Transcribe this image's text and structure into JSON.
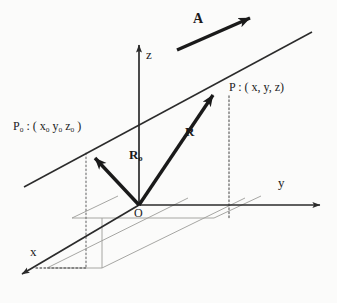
{
  "figure": {
    "background_color": "#fbfbfa",
    "ink_color": "#1a1a1a",
    "plane_line_color": "#9a9a96",
    "axes": [
      {
        "name": "z",
        "label": "z",
        "direction": "up"
      },
      {
        "name": "y",
        "label": "y",
        "direction": "right"
      },
      {
        "name": "x",
        "label": "x",
        "direction": "down-left"
      }
    ],
    "origin": {
      "label": "O"
    },
    "points": [
      {
        "name": "point-P",
        "label": "P : ( x, y, z)"
      },
      {
        "name": "point-P0",
        "label_main": "P",
        "label_sub": "o",
        "label_coords_open": " : ( x",
        "sub_x": "o",
        "mid_y": " y",
        "sub_y": "o",
        "mid_z": " z",
        "sub_z": "o",
        "label_close": " )"
      }
    ],
    "vectors": [
      {
        "name": "vector-A",
        "label": "A",
        "description": "direction vector of the line, bold arrow pointing up-right"
      },
      {
        "name": "vector-R",
        "label": "R",
        "description": "position vector from origin O to point P"
      },
      {
        "name": "vector-R0",
        "label_main": "R",
        "label_sub": "o",
        "description": "position vector from origin O to point P0"
      }
    ],
    "line": {
      "name": "straight-line",
      "description": "infinite straight line passing through P0 and P, parallel to A"
    },
    "projections": {
      "name": "xy-plane-projection",
      "description": "thin parallelogram in the xy-plane with dotted drop-lines from P and P0"
    }
  }
}
